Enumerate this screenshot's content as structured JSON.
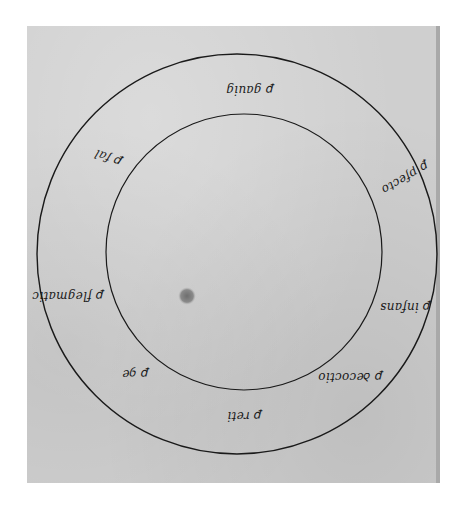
{
  "image": {
    "description": "Photograph of a manuscript page showing two concentric ink circles with handwritten (mirrored) labels placed around the ring between the circles and a small dark dot inside the inner circle."
  },
  "diagram": {
    "outer_circle": {
      "cx": 237,
      "cy": 254,
      "r": 200
    },
    "inner_circle": {
      "cx": 244,
      "cy": 252,
      "r": 138
    },
    "center_dot": {
      "cx": 187,
      "cy": 296,
      "r": 9
    },
    "labels": [
      {
        "id": "top",
        "text": "ꝑ gauig",
        "x": 250,
        "y": 90,
        "rotate": 180
      },
      {
        "id": "upper-left",
        "text": "ꝑ fal",
        "x": 108,
        "y": 158,
        "rotate": 200
      },
      {
        "id": "upper-right",
        "text": "ꝑ pfecto",
        "x": 405,
        "y": 178,
        "rotate": 150
      },
      {
        "id": "left",
        "text": "ꝑ flegmatic",
        "x": 68,
        "y": 296,
        "rotate": 180
      },
      {
        "id": "right",
        "text": "ꝑ infans",
        "x": 405,
        "y": 307,
        "rotate": 180
      },
      {
        "id": "lower-left",
        "text": "ꝑ ꝯe",
        "x": 135,
        "y": 374,
        "rotate": 180
      },
      {
        "id": "lower-right",
        "text": "ꝑ ꝺecoctio",
        "x": 350,
        "y": 377,
        "rotate": 180
      },
      {
        "id": "bottom",
        "text": "ꝑ reti",
        "x": 244,
        "y": 416,
        "rotate": 180
      }
    ]
  },
  "colors": {
    "paper": "#cfcfcf",
    "ink": "#1a1a1a",
    "background": "#ffffff",
    "dot": "#7a7a7a"
  }
}
